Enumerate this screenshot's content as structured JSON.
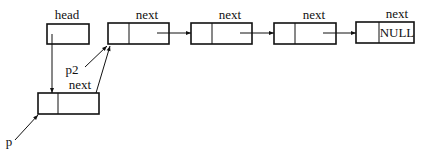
{
  "diagram": {
    "type": "linked-list-insertion",
    "labels": {
      "head": "head",
      "p": "p",
      "p2": "p2",
      "next_top_1": "next",
      "next_top_2": "next",
      "next_top_3": "next",
      "next_top_4": "next",
      "next_bottom": "next",
      "null_value": "NULL"
    },
    "nodes": [
      {
        "id": "head",
        "label": "head",
        "kind": "pointer-cell"
      },
      {
        "id": "node1",
        "label": "next",
        "kind": "list-node"
      },
      {
        "id": "node2",
        "label": "next",
        "kind": "list-node"
      },
      {
        "id": "node3",
        "label": "next",
        "kind": "list-node"
      },
      {
        "id": "node4",
        "label": "next",
        "kind": "list-node",
        "next_value": "NULL"
      },
      {
        "id": "new_node",
        "label": "next",
        "kind": "list-node"
      }
    ],
    "edges": [
      {
        "from": "head",
        "to": "new_node"
      },
      {
        "from": "new_node",
        "to": "node1"
      },
      {
        "from": "node1",
        "to": "node2"
      },
      {
        "from": "node2",
        "to": "node3"
      },
      {
        "from": "node3",
        "to": "node4"
      },
      {
        "from": "p",
        "to": "new_node"
      },
      {
        "from": "p2",
        "to": "node1"
      }
    ],
    "colors": {
      "stroke": "#111111",
      "background": "#ffffff"
    }
  }
}
